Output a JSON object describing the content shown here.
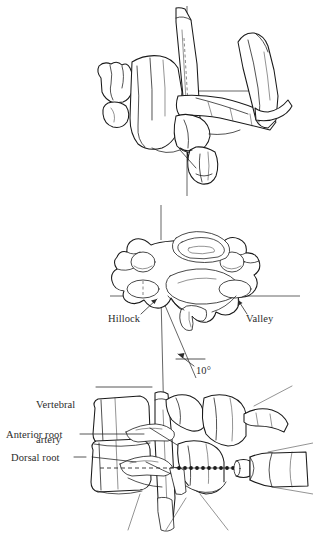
{
  "figure": {
    "background_color": "#ffffff",
    "ink_color": "#1a1a1a",
    "text_color": "#2b2b2b",
    "width": 313,
    "height": 537
  },
  "panels": {
    "top": {
      "name": "oblique-cervical-vertebra-view",
      "description": "Oblique three-dimensional view of a cervical vertebra with the vertebral artery ascending through the transverse foramen"
    },
    "middle": {
      "name": "axial-cervical-vertebra-view",
      "description": "Superior axial view of a cervical vertebra showing vertebral body, transverse foramina, vertebral canal and spinous process"
    },
    "bottom": {
      "name": "lateral-cervical-spine-needle-view",
      "description": "Lateral view of two cervical vertebrae with nerve roots, vertebral artery and a syringe needle along the approach trajectory"
    }
  },
  "labels": {
    "hillock": "Hillock",
    "valley": "Valley",
    "angle": "10°",
    "vertebral_artery_line1": "Vertebral",
    "vertebral_artery_line2": "artery",
    "anterior_root": "Anterior root",
    "dorsal_root": "Dorsal root"
  },
  "measurements": {
    "needle_angle_degrees": 10,
    "needle_angle_display": "10°"
  },
  "reference_lines": {
    "vertical_midline": "vertical reference line running through all three panels",
    "horizontal_top": "horizontal reference line across the oblique view",
    "horizontal_middle": "horizontal reference line across the axial view at the hillock level",
    "needle_trajectory": "dashed horizontal trajectory line to the needle tip"
  },
  "instrument": {
    "name": "syringe",
    "parts": [
      "barrel",
      "hub",
      "needle shaft"
    ]
  }
}
